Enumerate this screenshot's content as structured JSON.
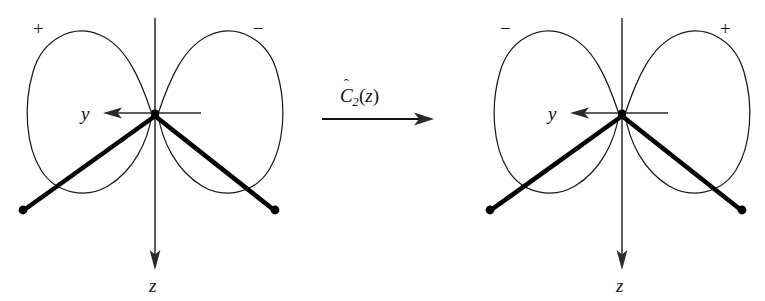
{
  "figure": {
    "kind": "orbital-symmetry-operation-diagram",
    "background_color": "#ffffff",
    "ink_color": "#000000"
  },
  "operator": {
    "name": "c2-z-rotation-operator",
    "hat": "ˆ",
    "symbol": "C",
    "subscript": "2",
    "open_paren": "(",
    "argument": "z",
    "close_paren": ")",
    "full_text": "Ĉ₂(z)",
    "arrow_direction": "right"
  },
  "left_diagram": {
    "name": "before-rotation",
    "lobes": [
      {
        "side": "left",
        "sign": "+"
      },
      {
        "side": "right",
        "sign": "−"
      }
    ],
    "axes": [
      {
        "id": "y",
        "label": "y",
        "direction": "left"
      },
      {
        "id": "z",
        "label": "z",
        "direction": "down"
      }
    ],
    "atoms": [
      {
        "id": "atom-left",
        "position": "lower-left"
      },
      {
        "id": "atom-right",
        "position": "lower-right"
      }
    ],
    "center_label": "origin"
  },
  "right_diagram": {
    "name": "after-rotation",
    "lobes": [
      {
        "side": "left",
        "sign": "−"
      },
      {
        "side": "right",
        "sign": "+"
      }
    ],
    "axes": [
      {
        "id": "y",
        "label": "y",
        "direction": "left"
      },
      {
        "id": "z",
        "label": "z",
        "direction": "down"
      }
    ],
    "atoms": [
      {
        "id": "atom-left",
        "position": "lower-left"
      },
      {
        "id": "atom-right",
        "position": "lower-right"
      }
    ],
    "center_label": "origin"
  }
}
